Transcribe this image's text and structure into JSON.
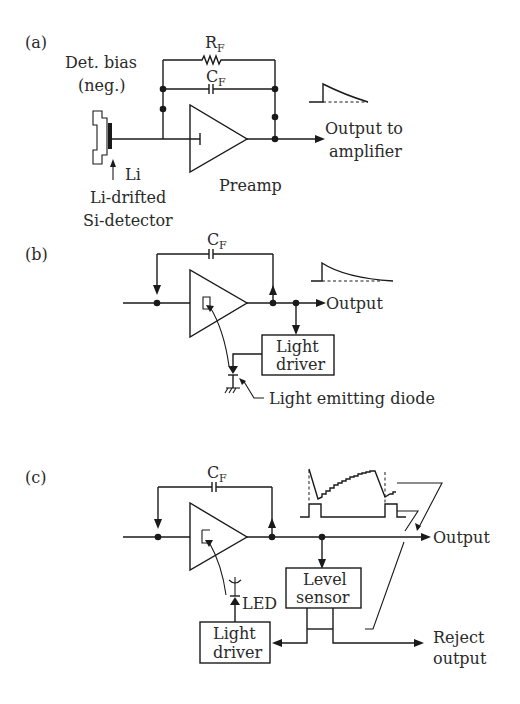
{
  "figure": {
    "panels": [
      {
        "id": "a",
        "label": "(a)",
        "components": {
          "feedback_resistor": "R",
          "feedback_resistor_sub": "F",
          "feedback_capacitor": "C",
          "feedback_capacitor_sub": "F",
          "amplifier": "Preamp"
        },
        "labels": {
          "bias_line1": "Det. bias",
          "bias_line2": "(neg.)",
          "li": "Li",
          "detector_line1": "Li-drifted",
          "detector_line2": "Si-detector",
          "output_line1": "Output to",
          "output_line2": "amplifier"
        }
      },
      {
        "id": "b",
        "label": "(b)",
        "components": {
          "feedback_capacitor": "C",
          "feedback_capacitor_sub": "F",
          "light_driver_line1": "Light",
          "light_driver_line2": "driver"
        },
        "labels": {
          "output": "Output",
          "led": "Light emitting diode"
        }
      },
      {
        "id": "c",
        "label": "(c)",
        "components": {
          "feedback_capacitor": "C",
          "feedback_capacitor_sub": "F",
          "level_sensor_line1": "Level",
          "level_sensor_line2": "sensor",
          "light_driver_line1": "Light",
          "light_driver_line2": "driver"
        },
        "labels": {
          "output": "Output",
          "led": "LED",
          "reject_line1": "Reject",
          "reject_line2": "output"
        }
      }
    ],
    "colors": {
      "ink": "#1a1a1a",
      "background": "#ffffff"
    }
  }
}
